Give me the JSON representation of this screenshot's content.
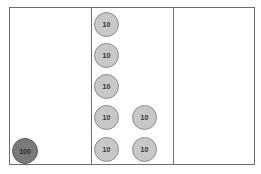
{
  "diagram": {
    "colors": {
      "border": "#6e6e6e",
      "ten_chip_fill": "#c8c8c8",
      "hundred_chip_fill": "#7a7a7a"
    },
    "columns": [
      {
        "chips": [
          {
            "label": "100",
            "type": "hundred",
            "x": 12,
            "y": 138
          }
        ]
      },
      {
        "chips": [
          {
            "label": "10",
            "type": "ten",
            "x": 94,
            "y": 12
          },
          {
            "label": "10",
            "type": "ten",
            "x": 94,
            "y": 43
          },
          {
            "label": "10",
            "type": "ten",
            "x": 94,
            "y": 74
          },
          {
            "label": "10",
            "type": "ten",
            "x": 94,
            "y": 105
          },
          {
            "label": "10",
            "type": "ten",
            "x": 132,
            "y": 105
          },
          {
            "label": "10",
            "type": "ten",
            "x": 94,
            "y": 137
          },
          {
            "label": "10",
            "type": "ten",
            "x": 132,
            "y": 137
          }
        ]
      },
      {
        "chips": []
      }
    ]
  }
}
